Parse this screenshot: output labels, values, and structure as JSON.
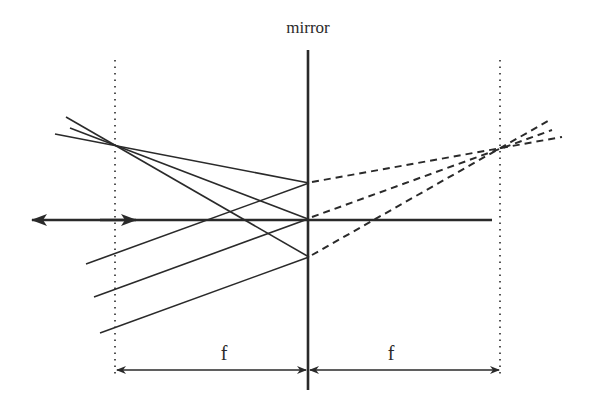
{
  "diagram": {
    "type": "ray-diagram",
    "labels": {
      "mirror": "mirror",
      "focal_left": "f",
      "focal_right": "f"
    },
    "colors": {
      "line": "#2a2a2a",
      "background": "#ffffff"
    },
    "elements": {
      "mirror_line": {
        "x": 308,
        "y1": 50,
        "y2": 390
      },
      "optical_axis": {
        "y": 220,
        "x1": 28,
        "x2": 492
      },
      "focal_plane_left": {
        "x": 115,
        "y1": 60,
        "y2": 376
      },
      "focal_plane_right": {
        "x": 500,
        "y1": 60,
        "y2": 376
      },
      "dimension_y": 370
    },
    "incident_rays": [
      {
        "from": [
          55,
          134
        ],
        "to": [
          309,
          183
        ]
      },
      {
        "from": [
          67,
          128
        ],
        "to": [
          308,
          219
        ]
      },
      {
        "from": [
          64,
          117
        ],
        "to": [
          309,
          257
        ]
      }
    ],
    "reflected_rays": [
      {
        "from": [
          309,
          183
        ],
        "to": [
          86,
          264
        ]
      },
      {
        "from": [
          308,
          219
        ],
        "to": [
          94,
          297
        ]
      },
      {
        "from": [
          309,
          257
        ],
        "to": [
          100,
          333
        ]
      }
    ],
    "virtual_extensions": [
      {
        "from": [
          309,
          183
        ],
        "to": [
          562,
          137
        ]
      },
      {
        "from": [
          308,
          219
        ],
        "to": [
          552,
          130
        ]
      },
      {
        "from": [
          309,
          257
        ],
        "to": [
          548,
          121
        ]
      }
    ]
  }
}
